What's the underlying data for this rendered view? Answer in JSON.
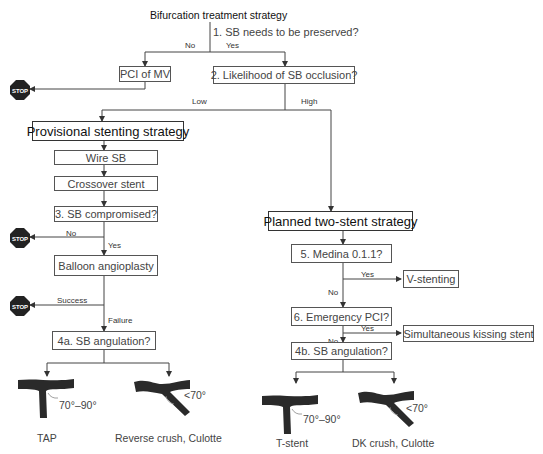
{
  "title": "Bifurcation treatment strategy",
  "q1": {
    "label": "1. SB needs to be preserved?",
    "no": "No",
    "yes": "Yes"
  },
  "pci_mv": "PCI of MV",
  "q2": {
    "label": "2. Likelihood of SB occlusion?",
    "low": "Low",
    "high": "High"
  },
  "provisional": {
    "title": "Provisional stenting strategy",
    "wire": "Wire SB",
    "crossover": "Crossover stent",
    "q3": "3. SB compromised?",
    "q3_no": "No",
    "q3_yes": "Yes",
    "balloon": "Balloon angioplasty",
    "success": "Success",
    "failure": "Failure",
    "q4a": "4a. SB angulation?",
    "left_angle": "70°–90°",
    "left_caption": "TAP",
    "right_angle": "<70°",
    "right_caption": "Reverse  crush, Culotte"
  },
  "two_stent": {
    "title": "Planned two-stent strategy",
    "q5": "5. Medina 0.1.1?",
    "q5_yes": "Yes",
    "q5_no": "No",
    "v_stenting": "V-stenting",
    "q6": "6. Emergency PCI?",
    "q6_yes": "Yes",
    "q6_no": "No",
    "sks": "Simultaneous kissing stent",
    "q4b": "4b. SB angulation?",
    "left_angle": "70°–90°",
    "left_caption": "T-stent",
    "right_angle": "<70°",
    "right_caption": "DK  crush, Culotte"
  },
  "stop_label": "STOP",
  "colors": {
    "line": "#333333",
    "stop": "#222222",
    "vessel": "#2a2a2a"
  }
}
